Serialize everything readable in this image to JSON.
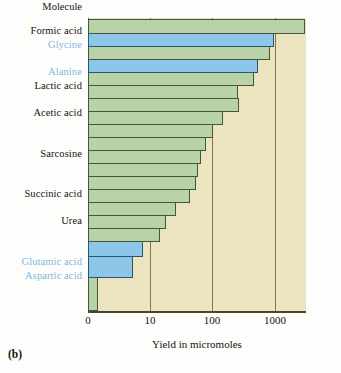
{
  "figure": {
    "panel_id": "(b)",
    "column_header": "Molecule",
    "xlabel": "Yield in micromoles"
  },
  "axis": {
    "ticks": [
      {
        "label": "0",
        "x": 88
      },
      {
        "label": "10",
        "x": 150
      },
      {
        "label": "100",
        "x": 212
      },
      {
        "label": "1000",
        "x": 275
      }
    ]
  },
  "colors": {
    "bar_green": "#b9d3a9",
    "bar_blue": "#8cc7ea",
    "plot_background": "#ece3bf",
    "label_highlight": "#7fb8e0",
    "label_normal": "#171310"
  },
  "chart_data": {
    "type": "bar",
    "orientation": "horizontal",
    "title": "",
    "xlabel": "Yield in micromoles",
    "ylabel": "Molecule",
    "xscale": "log",
    "xlim": [
      0,
      10000
    ],
    "grid": true,
    "xticks": [
      0,
      10,
      100,
      1000
    ],
    "legend": "Blue bars = amino acids (labels in blue); green bars = other organic compounds",
    "categories": [
      "Formic acid",
      "Glycine",
      "",
      "Alanine",
      "Lactic acid",
      "",
      "Acetic acid",
      "",
      "",
      "Sarcosine",
      "",
      "",
      "Succinic acid",
      "",
      "Urea",
      "",
      "",
      "Glutamic acid",
      "Aspartic acid",
      ""
    ],
    "values": [
      2330,
      630,
      560,
      340,
      310,
      150,
      152,
      88,
      60,
      50,
      43,
      40,
      38,
      32,
      21,
      15,
      13,
      6,
      4,
      2
    ],
    "series_colors": [
      "green",
      "blue",
      "green",
      "blue",
      "green",
      "green",
      "green",
      "green",
      "green",
      "green",
      "green",
      "green",
      "green",
      "green",
      "green",
      "green",
      "green",
      "blue",
      "blue",
      "green"
    ]
  },
  "row_labels": [
    {
      "text": "Molecule",
      "highlight": false,
      "top": 1
    },
    {
      "text": "Formic acid",
      "highlight": false,
      "top": 25
    },
    {
      "text": "Glycine",
      "highlight": true,
      "top": 39
    },
    {
      "text": "Alanine",
      "highlight": true,
      "top": 66
    },
    {
      "text": "Lactic acid",
      "highlight": false,
      "top": 80
    },
    {
      "text": "Acetic acid",
      "highlight": false,
      "top": 107
    },
    {
      "text": "Sarcosine",
      "highlight": false,
      "top": 148
    },
    {
      "text": "Succinic acid",
      "highlight": false,
      "top": 188
    },
    {
      "text": "Urea",
      "highlight": false,
      "top": 215
    },
    {
      "text": "Glutamic acid",
      "highlight": true,
      "top": 256
    },
    {
      "text": "Aspartic acid",
      "highlight": true,
      "top": 270
    }
  ],
  "bars": [
    {
      "name": "Formic acid",
      "top": 1,
      "height": 14.5,
      "width": 217,
      "color": "green"
    },
    {
      "name": "Glycine",
      "top": 15,
      "height": 13.5,
      "width": 186,
      "color": "blue"
    },
    {
      "name": "bar-3",
      "top": 28,
      "height": 13.5,
      "width": 182,
      "color": "green"
    },
    {
      "name": "Alanine",
      "top": 41,
      "height": 13.5,
      "width": 170,
      "color": "blue"
    },
    {
      "name": "Lactic acid",
      "top": 54,
      "height": 13.5,
      "width": 166,
      "color": "green"
    },
    {
      "name": "bar-6",
      "top": 67,
      "height": 13.5,
      "width": 150,
      "color": "green"
    },
    {
      "name": "Acetic acid",
      "top": 80,
      "height": 13.5,
      "width": 151,
      "color": "green"
    },
    {
      "name": "bar-8",
      "top": 93,
      "height": 13.5,
      "width": 135,
      "color": "green"
    },
    {
      "name": "bar-9",
      "top": 106,
      "height": 13.5,
      "width": 125,
      "color": "green"
    },
    {
      "name": "Sarcosine",
      "top": 119,
      "height": 13.5,
      "width": 118,
      "color": "green"
    },
    {
      "name": "bar-11",
      "top": 132,
      "height": 13.5,
      "width": 113,
      "color": "green"
    },
    {
      "name": "bar-12",
      "top": 145,
      "height": 13.5,
      "width": 110,
      "color": "green"
    },
    {
      "name": "Succinic acid",
      "top": 158,
      "height": 13.5,
      "width": 108,
      "color": "green"
    },
    {
      "name": "bar-14",
      "top": 171,
      "height": 13.5,
      "width": 102,
      "color": "green"
    },
    {
      "name": "Urea",
      "top": 184,
      "height": 13.5,
      "width": 88,
      "color": "green"
    },
    {
      "name": "bar-16",
      "top": 197,
      "height": 13.5,
      "width": 78,
      "color": "green"
    },
    {
      "name": "bar-17",
      "top": 210,
      "height": 13.5,
      "width": 72,
      "color": "green"
    },
    {
      "name": "Glutamic acid",
      "top": 223,
      "height": 16,
      "width": 55,
      "color": "blue"
    },
    {
      "name": "Aspartic acid",
      "top": 238,
      "height": 22,
      "width": 45,
      "color": "blue"
    },
    {
      "name": "bar-20",
      "top": 259,
      "height": 34,
      "width": 10,
      "color": "green"
    }
  ]
}
